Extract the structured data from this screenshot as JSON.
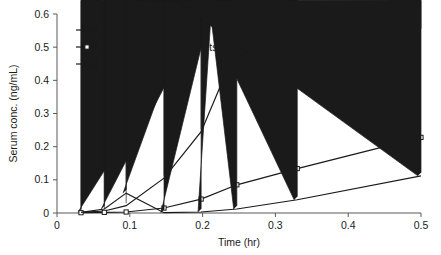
{
  "chart_data": {
    "type": "line",
    "title": "",
    "xlabel": "Time (hr)",
    "ylabel": "Serum conc. (ng/mL)",
    "xlim": [
      0,
      0.5
    ],
    "ylim": [
      0,
      0.6
    ],
    "xticks": [
      "0",
      "0.1",
      "0.2",
      "0.3",
      "0.4",
      "0.5"
    ],
    "xtick_values": [
      0,
      0.1,
      0.2,
      0.3,
      0.4,
      0.5
    ],
    "yticks": [
      "0",
      "0.1",
      "0.2",
      "0.3",
      "0.4",
      "0.5",
      "0.6"
    ],
    "ytick_values": [
      0,
      0.1,
      0.2,
      0.3,
      0.4,
      0.5,
      0.6
    ],
    "grid": false,
    "legend_position": "top-left",
    "series": [
      {
        "name": "OraVescent® tablets",
        "label_main": "OraVescent",
        "label_sup": "®",
        "label_tail": " tablets",
        "marker": "filled-diamond",
        "color": "#1a1a1a",
        "x": [
          0.033,
          0.065,
          0.095,
          0.147,
          0.198,
          0.247,
          0.33,
          0.5
        ],
        "y": [
          0.002,
          0.006,
          0.022,
          0.105,
          0.245,
          0.5,
          0.5,
          0.548
        ]
      },
      {
        "name": "Non-OraVescent tablets",
        "label_main": "Non-OraVescent tablets",
        "label_sup": "",
        "label_tail": "",
        "marker": "open-square",
        "color": "#1a1a1a",
        "x": [
          0.033,
          0.065,
          0.095,
          0.147,
          0.198,
          0.247,
          0.33,
          0.5
        ],
        "y": [
          0.001,
          0.002,
          0.003,
          0.015,
          0.042,
          0.085,
          0.134,
          0.228
        ]
      },
      {
        "name": "ACTIQ® lozenges",
        "label_main": "ACTIQ",
        "label_sup": "®",
        "label_tail": " lozenges",
        "marker": "filled-triangle",
        "color": "#1a1a1a",
        "x": [
          0.033,
          0.065,
          0.095,
          0.147,
          0.198,
          0.247,
          0.33,
          0.5
        ],
        "y": [
          0.002,
          0.012,
          0.06,
          0.001,
          0.003,
          0.012,
          0.04,
          0.112
        ]
      }
    ]
  },
  "axes": {
    "xlabel": "Time (hr)",
    "ylabel": "Serum conc. (ng/mL)"
  }
}
